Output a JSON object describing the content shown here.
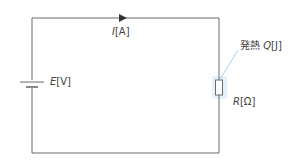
{
  "diagram": {
    "type": "circuit",
    "colors": {
      "wire": "#6b6b6b",
      "text": "#444444",
      "leader": "#8fc9e6",
      "glow": "#cfe9f7"
    },
    "current": {
      "symbol": "I",
      "unit": "[A]"
    },
    "emf": {
      "symbol": "E",
      "unit": "[V]"
    },
    "resistance": {
      "symbol": "R",
      "unit": "[Ω]"
    },
    "heat": {
      "prefix": "発熱",
      "symbol": "Q",
      "unit": "[J]"
    }
  }
}
